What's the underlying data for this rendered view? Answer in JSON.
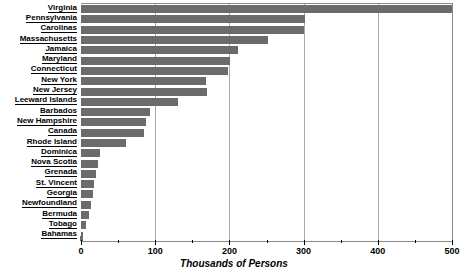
{
  "chart_data": {
    "type": "bar",
    "orientation": "horizontal",
    "title": "",
    "xlabel": "Thousands of Persons",
    "ylabel": "",
    "xlim": [
      0,
      500
    ],
    "xticks": [
      0,
      100,
      200,
      300,
      400,
      500
    ],
    "xtick_labels": [
      "0",
      "100",
      "200",
      "300",
      "400",
      "500"
    ],
    "minor_tick_interval": 50,
    "grid": "vertical major gridlines at 100, 200, 300, 400",
    "legend": "none",
    "bar_color": "#6b6b6b",
    "grid_color": "#a9a9a9",
    "axis_color": "#000000",
    "categories": [
      "Virginia",
      "Pennsylvania",
      "Carolinas",
      "Massachusetts",
      "Jamaica",
      "Maryland",
      "Connecticut",
      "New York",
      "New Jersey",
      "Leeward Islands",
      "Barbados",
      "New Hampshire",
      "Canada",
      "Rhode Island",
      "Dominica",
      "Nova Scotia",
      "Grenada",
      "St. Vincent",
      "Georgia",
      "Newfoundland",
      "Bermuda",
      "Tobago",
      "Bahamas"
    ],
    "values": [
      500,
      302,
      300,
      252,
      211,
      201,
      198,
      168,
      170,
      131,
      93,
      88,
      85,
      61,
      26,
      23,
      20,
      18,
      16,
      13,
      11,
      7,
      3
    ]
  }
}
